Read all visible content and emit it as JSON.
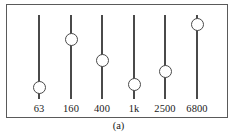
{
  "figure": {
    "caption": "(a)",
    "panel_name": "graphic-equalizer-panel",
    "colors": {
      "background": "#ffffff",
      "frame": "#5a5a5a",
      "track": "#4a4a4a",
      "knob_fill": "#ffffff",
      "knob_stroke": "#4a4a4a",
      "label_text": "#1a1a1a"
    }
  },
  "equalizer": {
    "track_top_px": 10,
    "track_bottom_px": 94,
    "bands": [
      {
        "label": "63",
        "center_x_px": 38,
        "knob_center_y_px": 82,
        "knob_position_pct": 14
      },
      {
        "label": "160",
        "center_x_px": 70,
        "knob_center_y_px": 34,
        "knob_position_pct": 71
      },
      {
        "label": "400",
        "center_x_px": 101,
        "knob_center_y_px": 55,
        "knob_position_pct": 46
      },
      {
        "label": "1k",
        "center_x_px": 133,
        "knob_center_y_px": 79,
        "knob_position_pct": 18
      },
      {
        "label": "2500",
        "center_x_px": 164,
        "knob_center_y_px": 66,
        "knob_position_pct": 33
      },
      {
        "label": "6800",
        "center_x_px": 196,
        "knob_center_y_px": 19,
        "knob_position_pct": 89
      }
    ],
    "label_row_y_px": 98
  }
}
